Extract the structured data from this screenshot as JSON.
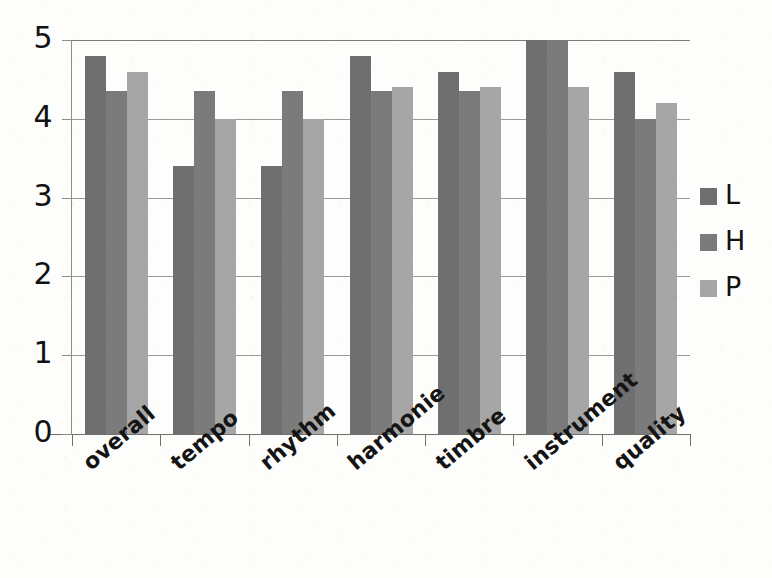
{
  "chart_data": {
    "type": "bar",
    "title": "",
    "subtitle": "",
    "xlabel": "",
    "ylabel": "",
    "ylim": [
      0,
      5
    ],
    "ytick_labels": [
      "5",
      "4",
      "3",
      "2",
      "1",
      "0"
    ],
    "ytick_values": [
      5,
      4,
      3,
      2,
      1,
      0
    ],
    "grid": true,
    "grid_axis": "y",
    "legend_position": "right",
    "categories": [
      "overall",
      "tempo",
      "rhythm",
      "harmonie",
      "timbre",
      "instrument",
      "quality"
    ],
    "series": [
      {
        "name": "L",
        "color": "#6f6f6f",
        "values": [
          4.8,
          3.4,
          3.4,
          4.8,
          4.6,
          5.0,
          4.6
        ]
      },
      {
        "name": "H",
        "color": "#7b7b7b",
        "values": [
          4.35,
          4.35,
          4.35,
          4.35,
          4.35,
          5.0,
          4.0
        ]
      },
      {
        "name": "P",
        "color": "#a6a6a6",
        "values": [
          4.6,
          4.0,
          4.0,
          4.4,
          4.4,
          4.4,
          4.2
        ]
      }
    ]
  },
  "legend": {
    "entries": [
      {
        "label": "L",
        "color": "#6f6f6f"
      },
      {
        "label": "H",
        "color": "#7b7b7b"
      },
      {
        "label": "P",
        "color": "#a6a6a6"
      }
    ]
  },
  "axes": {
    "y": {
      "labels": [
        "5",
        "4",
        "3",
        "2",
        "1",
        "0"
      ]
    },
    "x": {
      "labels": [
        "overall",
        "tempo",
        "rhythm",
        "harmonie",
        "timbre",
        "instrument",
        "quality"
      ]
    }
  },
  "colors": {
    "series_l": "#6f6f6f",
    "series_h": "#7b7b7b",
    "series_p": "#a6a6a6",
    "gridline": "#9a9a96",
    "axis": "#6f6f6b",
    "text": "#141414",
    "background": "#fdfdfc"
  }
}
